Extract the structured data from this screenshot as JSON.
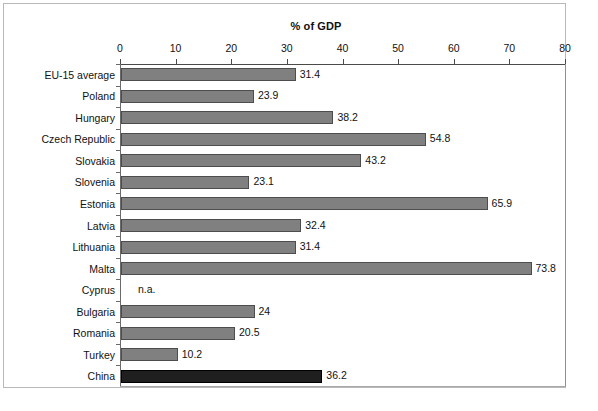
{
  "chart_data": {
    "type": "bar",
    "orientation": "horizontal",
    "title": "% of GDP",
    "xlabel": "",
    "ylabel": "",
    "xlim": [
      0,
      80
    ],
    "xticks": [
      0,
      10,
      20,
      30,
      40,
      50,
      60,
      70,
      80
    ],
    "xtick_labels": [
      "0",
      "10",
      "20",
      "30",
      "40",
      "50",
      "60",
      "70",
      "80"
    ],
    "grid": false,
    "legend": "none",
    "categories": [
      "EU-15 average",
      "Poland",
      "Hungary",
      "Czech Republic",
      "Slovakia",
      "Slovenia",
      "Estonia",
      "Latvia",
      "Lithuania",
      "Malta",
      "Cyprus",
      "Bulgaria",
      "Romania",
      "Turkey",
      "China"
    ],
    "values": [
      31.4,
      23.9,
      38.2,
      54.8,
      43.2,
      23.1,
      65.9,
      32.4,
      31.4,
      73.8,
      null,
      24,
      20.5,
      10.2,
      36.2
    ],
    "value_labels": [
      "31.4",
      "23.9",
      "38.2",
      "54.8",
      "43.2",
      "23.1",
      "65.9",
      "32.4",
      "31.4",
      "73.8",
      "n.a.",
      "24",
      "20.5",
      "10.2",
      "36.2"
    ],
    "missing_label": "n.a.",
    "bar_colors": [
      "gray",
      "gray",
      "gray",
      "gray",
      "gray",
      "gray",
      "gray",
      "gray",
      "gray",
      "gray",
      "none",
      "gray",
      "gray",
      "gray",
      "dark"
    ],
    "colors": {
      "bar_gray_fill": "#808080",
      "bar_gray_border": "#4d4d4d",
      "bar_dark_fill": "#1f1f1f",
      "bar_dark_border": "#000000",
      "axis": "#4a4a4a",
      "background": "#ffffff",
      "frame": "#b9b9b9"
    }
  }
}
